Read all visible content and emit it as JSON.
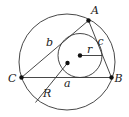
{
  "diagram": {
    "title": "",
    "colors": {
      "stroke": "#333333",
      "dot": "#111111",
      "text": "#222222",
      "background": "#ffffff"
    },
    "circumcircle": {
      "cx": 67,
      "cy": 62,
      "r": 48
    },
    "incircle": {
      "cx": 80,
      "cy": 55.5,
      "r": 22
    },
    "vertices": {
      "A": {
        "x": 88.5,
        "y": 20.5,
        "label": "A",
        "lx": 91,
        "ly": 14
      },
      "B": {
        "x": 111.5,
        "y": 77.5,
        "label": "B",
        "lx": 114.5,
        "ly": 82
      },
      "C": {
        "x": 21.5,
        "y": 77.5,
        "label": "C",
        "lx": 8,
        "ly": 82
      }
    },
    "centers": {
      "incenter": {
        "x": 80,
        "y": 55.5
      },
      "circumcenter": {
        "x": 67.5,
        "y": 63
      }
    },
    "labels": {
      "side_a": "a",
      "side_b": "b",
      "side_c": "c",
      "inradius": "r",
      "circumradius": "R"
    }
  }
}
